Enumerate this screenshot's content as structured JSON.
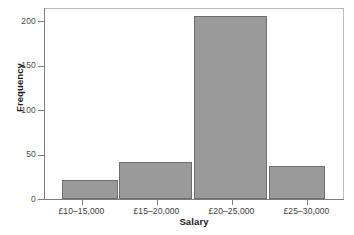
{
  "chart_data": {
    "type": "bar",
    "title": "",
    "xlabel": "Salary",
    "ylabel": "Frequency",
    "categories": [
      "£10–15,000",
      "£15–20,000",
      "£20–25,000",
      "£25–30,000"
    ],
    "values": [
      21,
      42,
      206,
      37
    ],
    "ylim": [
      0,
      215
    ],
    "yticks": [
      0,
      50,
      100,
      150,
      200
    ],
    "ytick_labels": [
      "0",
      "50",
      "100",
      "150",
      "200"
    ],
    "grid": false,
    "legend": null,
    "bar_color": "#9a9a9a",
    "bar_edge_color": "#6e6e6e",
    "axis_color": "#7d7d7d",
    "frame_color": "#b9b9b9",
    "background": "#ffffff"
  }
}
